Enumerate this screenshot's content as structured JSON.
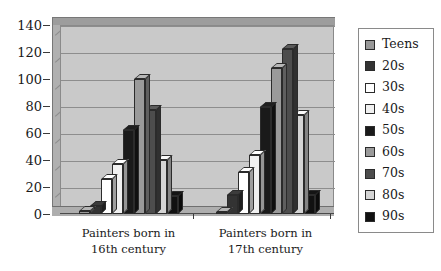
{
  "chart_data": {
    "type": "bar",
    "title": "",
    "subtitle": "",
    "xlabel": "",
    "ylabel": "",
    "ylim": [
      0,
      140
    ],
    "ytick_labels": [
      "0",
      "20",
      "40",
      "60",
      "80",
      "100",
      "120",
      "140"
    ],
    "ytick_values": [
      0,
      20,
      40,
      60,
      80,
      100,
      120,
      140
    ],
    "grid": true,
    "legend_position": "right",
    "style": "3d-grayscale-column",
    "categories": [
      "Painters born in\n16th century",
      "Painters born in\n17th century"
    ],
    "series": [
      {
        "name": "Teens",
        "color": "#999999",
        "values": [
          2,
          1
        ]
      },
      {
        "name": "20s",
        "color": "#333333",
        "values": [
          6,
          14
        ]
      },
      {
        "name": "30s",
        "color": "#ffffff",
        "values": [
          26,
          31
        ]
      },
      {
        "name": "40s",
        "color": "#f0f0f0",
        "values": [
          37,
          44
        ]
      },
      {
        "name": "50s",
        "color": "#1a1a1a",
        "values": [
          62,
          79
        ]
      },
      {
        "name": "60s",
        "color": "#9a9a9a",
        "values": [
          100,
          108
        ]
      },
      {
        "name": "70s",
        "color": "#4d4d4d",
        "values": [
          77,
          122
        ]
      },
      {
        "name": "80s",
        "color": "#d4d4d4",
        "values": [
          40,
          73
        ]
      },
      {
        "name": "90s",
        "color": "#111111",
        "values": [
          13,
          14
        ]
      }
    ]
  },
  "legend": {
    "items": [
      {
        "label": "Teens"
      },
      {
        "label": "20s"
      },
      {
        "label": "30s"
      },
      {
        "label": "40s"
      },
      {
        "label": "50s"
      },
      {
        "label": "60s"
      },
      {
        "label": "70s"
      },
      {
        "label": "80s"
      },
      {
        "label": "90s"
      }
    ]
  },
  "colors": {
    "plot_wall": "#c9c9c9",
    "plot_wall_top": "#9d9d9d",
    "plot_wall_side": "#b0b0b0",
    "gridline": "#8d8d8d",
    "axis": "#3a3a3a",
    "text": "#1a1a1a",
    "background": "#ffffff",
    "legend_border": "#8a8a8a"
  }
}
